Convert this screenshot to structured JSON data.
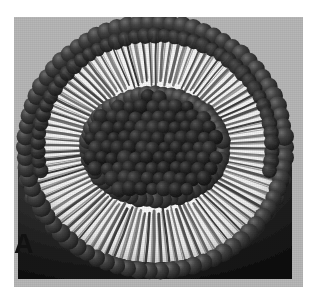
{
  "figure": {
    "panel_label": "A",
    "alt_description": "Cutaway diagram of a unilamellar liposome vesicle showing a phospholipid bilayer: spherical head groups on the outer and inner surfaces with hydrophobic tails between them",
    "canvas": {
      "width": 318,
      "height": 305
    }
  },
  "plate": {
    "background_color": "#b7b7b7",
    "left": 14,
    "top": 17,
    "width": 289,
    "height": 270
  },
  "colors": {
    "page_background": "#ffffff",
    "plate_background": "#b7b7b7",
    "head_group_dark": "#2b2b2b",
    "head_group_mid": "#3d3d3d",
    "head_group_highlight": "#6e6e6e",
    "core_dark": "#1d1d1d",
    "tail_light": "#f4f4f4",
    "tail_shadow": "#3a3a3a",
    "label_color": "#111111"
  },
  "geometry": {
    "vesicle_center_x": 141,
    "vesicle_center_y": 130,
    "vesicle_radius_x": 137,
    "vesicle_radius_y": 126,
    "outer_head_ring_radius": 128,
    "tail_band_inner_radius": 72,
    "core_radius_x": 70,
    "core_radius_y": 54,
    "dome_top_y": 178,
    "outer_head_count": 74,
    "inner_head_count": 52,
    "tail_strand_count": 96,
    "dome_sphere_rows": 9
  },
  "structures": [
    {
      "name": "outer-leaflet-head-groups",
      "label": "outer leaflet phosphate head groups"
    },
    {
      "name": "hydrophobic-tail-region",
      "label": "hydrophobic fatty acid tails"
    },
    {
      "name": "inner-leaflet-head-groups",
      "label": "inner leaflet phosphate head groups"
    },
    {
      "name": "aqueous-core",
      "label": "aqueous interior"
    },
    {
      "name": "lower-dome-surface",
      "label": "intact lower hemisphere surface"
    }
  ]
}
